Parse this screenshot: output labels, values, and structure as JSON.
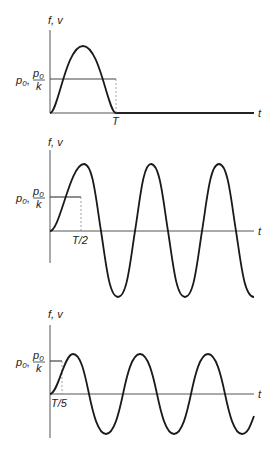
{
  "figure": {
    "panels": [
      {
        "y_label": "f, v",
        "level_label_left": "p",
        "level_label_sub": "0",
        "level_label_sep": ",",
        "frac_num": "p",
        "frac_num_sub": "0",
        "frac_den": "k",
        "x_label": "t",
        "tick_label": "T",
        "description": "Half-sine-like pulse of duration T; force level p0 (static response p0/k)"
      },
      {
        "y_label": "f, v",
        "level_label_left": "p",
        "level_label_sub": "0",
        "level_label_sep": ",",
        "frac_num": "p",
        "frac_num_sub": "0",
        "frac_den": "k",
        "x_label": "t",
        "tick_label": "T/2",
        "description": "Step force of duration T/2 followed by free oscillation"
      },
      {
        "y_label": "f, v",
        "level_label_left": "p",
        "level_label_sub": "0",
        "level_label_sep": ",",
        "frac_num": "p",
        "frac_num_sub": "0",
        "frac_den": "k",
        "x_label": "t",
        "tick_label": "T/5",
        "description": "Step force of duration T/5 followed by free oscillation"
      }
    ]
  },
  "colors": {
    "axis": "#555555",
    "curve": "#1a1a1a",
    "dashed": "#888888"
  }
}
